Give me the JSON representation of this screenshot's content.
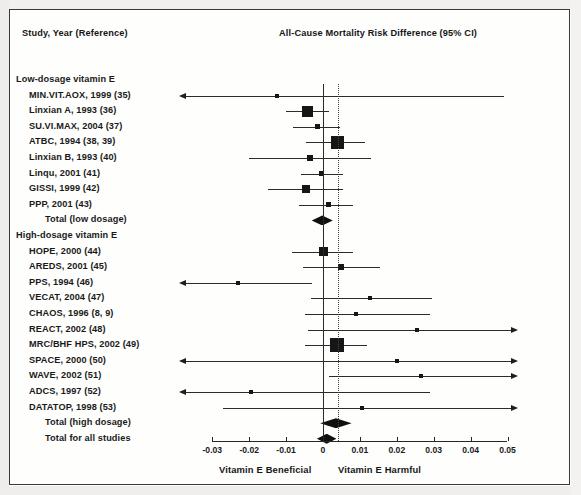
{
  "figure": {
    "label_column_header": "Study, Year (Reference)",
    "plot_column_header": "All-Cause Mortality Risk Difference (95% CI)",
    "footer_left": "Vitamin E Beneficial",
    "footer_right": "Vitamin E Harmful"
  },
  "chart_data": {
    "type": "scatter",
    "subtype": "forest-plot",
    "title": "All-Cause Mortality Risk Difference (95% CI)",
    "xlabel": "Risk Difference",
    "ylabel": "Study, Year (Reference)",
    "xlim": [
      -0.035,
      0.055
    ],
    "grid": false,
    "legend": null,
    "reference_lines": [
      {
        "name": "null-effect",
        "value": 0,
        "style": "solid"
      },
      {
        "name": "pooled-estimate",
        "value": 0.0042,
        "style": "dotted"
      }
    ],
    "tick_labels": [
      "-0.03",
      "-0.02",
      "-0.01",
      "0",
      "0.01",
      "0.02",
      "0.03",
      "0.04",
      "0.05"
    ],
    "tick_values": [
      -0.03,
      -0.02,
      -0.01,
      0,
      0.01,
      0.02,
      0.03,
      0.04,
      0.05
    ],
    "footer_left": "Vitamin E Beneficial",
    "footer_right": "Vitamin E Harmful",
    "rows": [
      {
        "kind": "group",
        "label": "Low-dosage vitamin E"
      },
      {
        "kind": "study",
        "label": "MIN.VIT.AOX, 1999 (35)",
        "estimate": -0.0125,
        "ci_low": -0.042,
        "ci_high": 0.049,
        "ci_low_truncated": true,
        "ci_high_truncated": false,
        "marker_size": 4
      },
      {
        "kind": "study",
        "label": "Linxian A, 1993 (36)",
        "estimate": -0.0043,
        "ci_low": -0.01,
        "ci_high": 0.0015,
        "ci_low_truncated": false,
        "ci_high_truncated": false,
        "marker_size": 11
      },
      {
        "kind": "study",
        "label": "SU.VI.MAX, 2004 (37)",
        "estimate": -0.0014,
        "ci_low": -0.008,
        "ci_high": 0.0046,
        "ci_low_truncated": false,
        "ci_high_truncated": false,
        "marker_size": 5
      },
      {
        "kind": "study",
        "label": "ATBC, 1994 (38, 39)",
        "estimate": 0.0038,
        "ci_low": -0.0045,
        "ci_high": 0.0115,
        "ci_low_truncated": false,
        "ci_high_truncated": false,
        "marker_size": 13
      },
      {
        "kind": "study",
        "label": "Linxian B, 1993 (40)",
        "estimate": -0.0035,
        "ci_low": -0.02,
        "ci_high": 0.013,
        "ci_low_truncated": false,
        "ci_high_truncated": false,
        "marker_size": 6
      },
      {
        "kind": "study",
        "label": "Linqu, 2001 (41)",
        "estimate": -0.0005,
        "ci_low": -0.006,
        "ci_high": 0.0055,
        "ci_low_truncated": false,
        "ci_high_truncated": false,
        "marker_size": 5
      },
      {
        "kind": "study",
        "label": "GISSI, 1999 (42)",
        "estimate": -0.0045,
        "ci_low": -0.015,
        "ci_high": 0.0055,
        "ci_low_truncated": false,
        "ci_high_truncated": false,
        "marker_size": 8
      },
      {
        "kind": "study",
        "label": "PPP, 2001 (43)",
        "estimate": 0.0015,
        "ci_low": -0.0065,
        "ci_high": 0.008,
        "ci_low_truncated": false,
        "ci_high_truncated": false,
        "marker_size": 5
      },
      {
        "kind": "summary",
        "label": "Total (low dosage)",
        "estimate": -0.0002,
        "ci_low": -0.003,
        "ci_high": 0.0027
      },
      {
        "kind": "group",
        "label": "High-dosage vitamin E"
      },
      {
        "kind": "study",
        "label": "HOPE, 2000 (44)",
        "estimate": 0.0,
        "ci_low": -0.0085,
        "ci_high": 0.0082,
        "ci_low_truncated": false,
        "ci_high_truncated": false,
        "marker_size": 9
      },
      {
        "kind": "study",
        "label": "AREDS, 2001 (45)",
        "estimate": 0.005,
        "ci_low": -0.0055,
        "ci_high": 0.0155,
        "ci_low_truncated": false,
        "ci_high_truncated": false,
        "marker_size": 6
      },
      {
        "kind": "study",
        "label": "PPS, 1994 (46)",
        "estimate": -0.023,
        "ci_low": -0.04,
        "ci_high": -0.003,
        "ci_low_truncated": true,
        "ci_high_truncated": false,
        "marker_size": 4
      },
      {
        "kind": "study",
        "label": "VECAT, 2004 (47)",
        "estimate": 0.0128,
        "ci_low": -0.0033,
        "ci_high": 0.0295,
        "ci_low_truncated": false,
        "ci_high_truncated": false,
        "marker_size": 4
      },
      {
        "kind": "study",
        "label": "CHAOS, 1996 (8, 9)",
        "estimate": 0.009,
        "ci_low": -0.005,
        "ci_high": 0.029,
        "ci_low_truncated": false,
        "ci_high_truncated": false,
        "marker_size": 4
      },
      {
        "kind": "study",
        "label": "REACT, 2002 (48)",
        "estimate": 0.0255,
        "ci_low": -0.004,
        "ci_high": 0.051,
        "ci_low_truncated": false,
        "ci_high_truncated": true,
        "marker_size": 4
      },
      {
        "kind": "study",
        "label": "MRC/BHF HPS, 2002 (49)",
        "estimate": 0.0038,
        "ci_low": -0.005,
        "ci_high": 0.0118,
        "ci_low_truncated": false,
        "ci_high_truncated": false,
        "marker_size": 14
      },
      {
        "kind": "study",
        "label": "SPACE, 2000 (50)",
        "estimate": 0.02,
        "ci_low": -0.039,
        "ci_high": 0.051,
        "ci_low_truncated": true,
        "ci_high_truncated": true,
        "marker_size": 4
      },
      {
        "kind": "study",
        "label": "WAVE, 2002 (51)",
        "estimate": 0.0265,
        "ci_low": 0.0016,
        "ci_high": 0.051,
        "ci_low_truncated": false,
        "ci_high_truncated": true,
        "marker_size": 4
      },
      {
        "kind": "study",
        "label": "ADCS, 1997 (52)",
        "estimate": -0.0195,
        "ci_low": -0.04,
        "ci_high": 0.029,
        "ci_low_truncated": true,
        "ci_high_truncated": false,
        "marker_size": 4
      },
      {
        "kind": "study",
        "label": "DATATOP, 1998 (53)",
        "estimate": 0.0105,
        "ci_low": -0.027,
        "ci_high": 0.051,
        "ci_low_truncated": false,
        "ci_high_truncated": true,
        "marker_size": 4
      },
      {
        "kind": "summary",
        "label": "Total (high dosage)",
        "estimate": 0.0035,
        "ci_low": -0.0005,
        "ci_high": 0.008
      },
      {
        "kind": "summary",
        "label": "Total for all studies",
        "estimate": 0.001,
        "ci_low": -0.0015,
        "ci_high": 0.0038
      }
    ]
  },
  "geometry": {
    "x_zero_px": 323,
    "px_per_unit": 3690,
    "row_top_px": 80,
    "row_step_px": 15.6,
    "axis_y_px": 441,
    "plot_clip_left_px": 186,
    "plot_clip_right_px": 548
  }
}
